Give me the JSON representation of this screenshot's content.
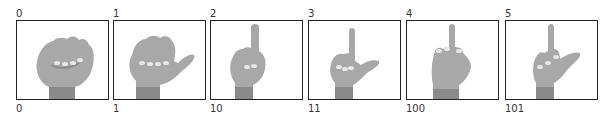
{
  "figure": {
    "panels": [
      {
        "decimal": "0",
        "binary": "0",
        "gesture": "closed fist",
        "icon": "fist-hand-icon",
        "x": 16
      },
      {
        "decimal": "1",
        "binary": "1",
        "gesture": "thumb extended",
        "icon": "thumb-out-hand-icon",
        "x": 113
      },
      {
        "decimal": "2",
        "binary": "10",
        "gesture": "index finger raised",
        "icon": "index-up-hand-icon",
        "x": 210
      },
      {
        "decimal": "3",
        "binary": "11",
        "gesture": "index finger and thumb extended",
        "icon": "index-thumb-hand-icon",
        "x": 308
      },
      {
        "decimal": "4",
        "binary": "100",
        "gesture": "middle finger raised",
        "icon": "middle-up-hand-icon",
        "x": 406
      },
      {
        "decimal": "5",
        "binary": "101",
        "gesture": "middle finger and thumb extended",
        "icon": "middle-thumb-hand-icon",
        "x": 505
      }
    ],
    "colors": {
      "hand": "#a8a8a8",
      "hand_shadow": "#8a8a8a",
      "nail": "#e6e6e6",
      "frame": "#222222"
    }
  }
}
